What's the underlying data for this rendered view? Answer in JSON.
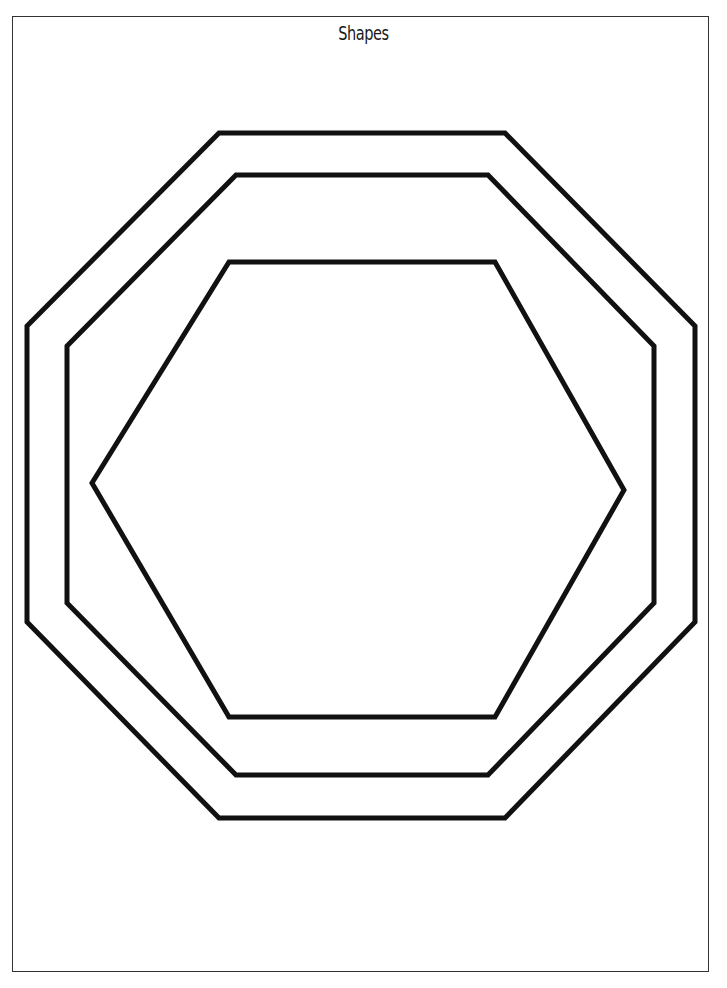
{
  "page": {
    "title": "Shapes",
    "border_color": "#333333",
    "background": "#ffffff"
  },
  "shapes": [
    {
      "name": "outer-octagon",
      "type": "octagon",
      "stroke": "#111111",
      "stroke_width": 5,
      "points": "219,133 505,133 695,326 695,622 505,818 219,818 27,622 27,326"
    },
    {
      "name": "inner-octagon",
      "type": "octagon",
      "stroke": "#111111",
      "stroke_width": 5,
      "points": "236,175 488,175 654,346 654,603 488,775 236,775 67,603 67,346"
    },
    {
      "name": "hexagon",
      "type": "hexagon",
      "stroke": "#111111",
      "stroke_width": 5,
      "points": "229,262 495,262 624,490 495,717 229,717 92,483"
    }
  ]
}
